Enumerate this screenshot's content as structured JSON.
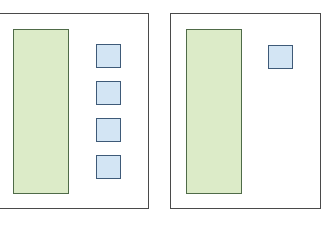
{
  "diagram": {
    "colors": {
      "panel_border": "#4a4a4a",
      "green_fill": "#dcebc8",
      "green_border": "#4f6b48",
      "blue_fill": "#d3e5f4",
      "blue_border": "#3e5a78"
    },
    "panels": [
      {
        "name": "left-panel",
        "box": {
          "x": -10,
          "y": 13,
          "w": 159,
          "h": 196
        },
        "tall_rect": {
          "x": 13,
          "y": 29,
          "w": 56,
          "h": 165
        },
        "squares": [
          {
            "x": 96,
            "y": 44,
            "w": 25,
            "h": 24
          },
          {
            "x": 96,
            "y": 81,
            "w": 25,
            "h": 24
          },
          {
            "x": 96,
            "y": 118,
            "w": 25,
            "h": 24
          },
          {
            "x": 96,
            "y": 155,
            "w": 25,
            "h": 24
          }
        ]
      },
      {
        "name": "right-panel",
        "box": {
          "x": 170,
          "y": 13,
          "w": 151,
          "h": 196
        },
        "tall_rect": {
          "x": 186,
          "y": 29,
          "w": 56,
          "h": 165
        },
        "squares": [
          {
            "x": 268,
            "y": 45,
            "w": 25,
            "h": 24
          }
        ]
      }
    ]
  }
}
